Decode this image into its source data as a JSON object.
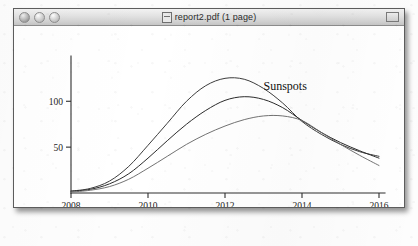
{
  "window": {
    "title": "report2.pdf (1 page)",
    "doc_icon": "document-icon",
    "traffic_lights": [
      {
        "name": "close",
        "label": "Close"
      },
      {
        "name": "minimize",
        "label": "Minimize"
      },
      {
        "name": "zoom",
        "label": "Zoom"
      }
    ],
    "toolbar_widget": "window-resize-widget"
  },
  "chart_data": {
    "type": "line",
    "title": "",
    "annotations": [
      {
        "text": "Sunspots",
        "x": 2013.0,
        "y": 112
      }
    ],
    "xlabel": "",
    "ylabel": "",
    "xlim": [
      2008,
      2016
    ],
    "ylim": [
      0,
      145
    ],
    "xticks": [
      2008,
      2010,
      2012,
      2014,
      2016
    ],
    "xtick_labels": [
      "2008",
      "2010",
      "2012",
      "2014",
      "2016"
    ],
    "yticks": [
      50,
      100
    ],
    "ytick_labels": [
      "50",
      "100"
    ],
    "grid": false,
    "legend": false,
    "x": [
      2008,
      2008.5,
      2009,
      2009.5,
      2010,
      2010.5,
      2011,
      2011.5,
      2012,
      2012.5,
      2013,
      2013.5,
      2014,
      2014.5,
      2015,
      2015.5,
      2016
    ],
    "series": [
      {
        "name": "upper",
        "color": "#3c3c3c",
        "values": [
          2,
          5,
          13,
          29,
          52,
          76,
          100,
          117,
          125,
          124,
          114,
          98,
          78,
          64,
          53,
          45,
          40
        ]
      },
      {
        "name": "middle",
        "color": "#2b2b2b",
        "values": [
          2,
          4,
          10,
          21,
          38,
          57,
          75,
          90,
          101,
          105,
          102,
          93,
          79,
          66,
          55,
          46,
          38
        ]
      },
      {
        "name": "lower",
        "color": "#6a6a6a",
        "values": [
          1,
          3,
          7,
          15,
          27,
          40,
          53,
          64,
          73,
          80,
          84,
          84,
          79,
          66,
          53,
          41,
          30
        ]
      }
    ]
  }
}
